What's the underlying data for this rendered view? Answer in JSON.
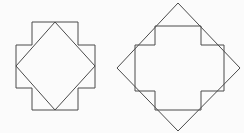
{
  "canvas": {
    "width": 244,
    "height": 133,
    "background_color": "#fbfbfb"
  },
  "style": {
    "stroke_color": "#4a4a4a",
    "stroke_width": 1,
    "fill": "none"
  },
  "figures": [
    {
      "id": "figure-left",
      "description": "Greek cross with inscribed rotated square touching arm-edge midpoints",
      "shapes": [
        {
          "name": "cross-outline",
          "type": "polygon",
          "points": "32,22 78,22 78,45 95,45 95,88 78,88 78,110 32,110 32,88 16,88 16,45 32,45"
        },
        {
          "name": "inscribed-diamond",
          "type": "polygon",
          "points": "55,22 95,66 55,110 16,66"
        }
      ]
    },
    {
      "id": "figure-right",
      "description": "Large rotated square (diamond) with inscribed cross whose arm corners meet the diamond edges",
      "shapes": [
        {
          "name": "diamond-outline",
          "type": "polygon",
          "points": "178,3 240,68 178,131 117,68"
        },
        {
          "name": "inscribed-cross",
          "type": "polygon",
          "points": "155,26 201,26 201,45 224,45 224,91 201,91 201,110 155,110 155,91 135,91 135,45 155,45"
        }
      ]
    }
  ]
}
